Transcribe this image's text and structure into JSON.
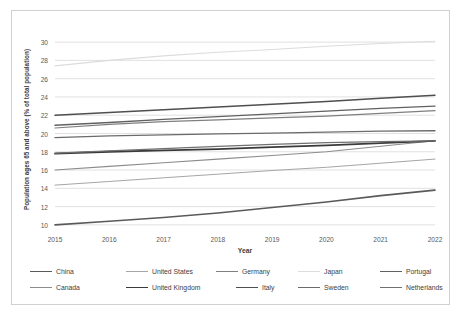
{
  "chart_data": {
    "type": "line",
    "title": "",
    "xlabel": "Year",
    "ylabel": "Population ages 65 and above (% of total population)",
    "x": [
      2015,
      2016,
      2017,
      2018,
      2019,
      2020,
      2021,
      2022
    ],
    "xtick_labels": [
      "2015",
      "2016",
      "2017",
      "2018",
      "2019",
      "2020",
      "2021",
      "2022"
    ],
    "ytick_labels": [
      "30",
      "28",
      "26",
      "24",
      "22",
      "20",
      "18",
      "16",
      "14",
      "12",
      "10"
    ],
    "yticks": [
      30,
      28,
      26,
      24,
      22,
      20,
      18,
      16,
      14,
      12,
      10
    ],
    "ylim": [
      9,
      31
    ],
    "xlim": [
      2015,
      2022
    ],
    "grid": "horizontal",
    "legend_position": "bottom",
    "series": [
      {
        "name": "China",
        "color": "#5a5a5a",
        "width": 1.6,
        "values": [
          10.0,
          10.4,
          10.8,
          11.3,
          11.9,
          12.5,
          13.2,
          13.8
        ]
      },
      {
        "name": "United States",
        "color": "#a6a6a6",
        "width": 1.0,
        "values": [
          14.35,
          14.75,
          15.15,
          15.55,
          15.95,
          16.3,
          16.75,
          17.2
        ]
      },
      {
        "name": "Germany",
        "color": "#7f7f7f",
        "width": 1.2,
        "values": [
          20.6,
          21.0,
          21.3,
          21.5,
          21.7,
          21.9,
          22.2,
          22.5
        ]
      },
      {
        "name": "Japan",
        "color": "#dcdcdc",
        "width": 1.1,
        "values": [
          27.4,
          28.0,
          28.5,
          28.9,
          29.2,
          29.55,
          29.85,
          30.1
        ]
      },
      {
        "name": "Portugal",
        "color": "#616161",
        "width": 1.4,
        "values": [
          20.9,
          21.2,
          21.55,
          21.85,
          22.15,
          22.45,
          22.75,
          23.0
        ]
      },
      {
        "name": "Canada",
        "color": "#8c8c8c",
        "width": 1.1,
        "values": [
          16.0,
          16.4,
          16.8,
          17.2,
          17.6,
          18.0,
          18.6,
          19.2
        ]
      },
      {
        "name": "United Kingdom",
        "color": "#3a3a3a",
        "width": 1.8,
        "values": [
          17.8,
          18.0,
          18.15,
          18.3,
          18.5,
          18.7,
          18.95,
          19.2
        ]
      },
      {
        "name": "Italy",
        "color": "#4f4f4f",
        "width": 1.5,
        "values": [
          22.0,
          22.3,
          22.6,
          22.9,
          23.2,
          23.5,
          23.85,
          24.2
        ]
      },
      {
        "name": "Sweden",
        "color": "#6b6b6b",
        "width": 1.3,
        "values": [
          19.55,
          19.75,
          19.85,
          19.95,
          20.05,
          20.15,
          20.25,
          20.3
        ]
      },
      {
        "name": "Netherlands",
        "color": "#707070",
        "width": 1.2,
        "values": [
          17.85,
          18.1,
          18.35,
          18.6,
          18.8,
          19.0,
          19.1,
          19.2
        ]
      }
    ]
  },
  "legend": {
    "row1": [
      "China",
      "United States",
      "Germany",
      "Japan",
      "Portugal"
    ],
    "row2": [
      "Canada",
      "United Kingdom",
      "Italy",
      "Sweden",
      "Netherlands"
    ]
  },
  "colors": {
    "frame": "#d0d0d0",
    "gridline": "#d9d9d9",
    "text": "#404040",
    "tick_text": "#595959",
    "background": "#ffffff"
  }
}
